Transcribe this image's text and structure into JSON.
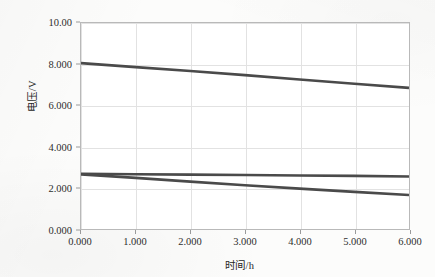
{
  "chart_data": {
    "type": "line",
    "title": "",
    "xlabel": "时间/h",
    "ylabel": "电压/V",
    "xlim": [
      0,
      6
    ],
    "ylim": [
      0,
      10
    ],
    "grid": true,
    "legend": "none",
    "x_tick_labels": [
      "0.000",
      "1.000",
      "2.000",
      "3.000",
      "4.000",
      "5.000",
      "6.000"
    ],
    "x_tick_values": [
      0,
      1,
      2,
      3,
      4,
      5,
      6
    ],
    "y_tick_labels": [
      "0.000",
      "2.000",
      "4.000",
      "6.000",
      "8.000",
      "10.00"
    ],
    "y_tick_values": [
      0,
      2,
      4,
      6,
      8,
      10
    ],
    "line_color": "#4a4a4a",
    "grid_color": "#e2e2e2",
    "axis_color": "#b9b9b9",
    "series": [
      {
        "name": "曲线1",
        "color": "#4a4a4a",
        "x": [
          0,
          1,
          2,
          3,
          4,
          5,
          6
        ],
        "values": [
          8.05,
          7.86,
          7.67,
          7.47,
          7.26,
          7.05,
          6.85
        ]
      },
      {
        "name": "曲线2",
        "color": "#4a4a4a",
        "x": [
          0,
          1,
          2,
          3,
          4,
          5,
          6
        ],
        "values": [
          2.68,
          2.66,
          2.64,
          2.62,
          2.6,
          2.58,
          2.55
        ]
      },
      {
        "name": "曲线3",
        "color": "#4a4a4a",
        "x": [
          0,
          1,
          2,
          3,
          4,
          5,
          6
        ],
        "values": [
          2.65,
          2.48,
          2.3,
          2.12,
          1.96,
          1.8,
          1.65
        ]
      }
    ]
  }
}
